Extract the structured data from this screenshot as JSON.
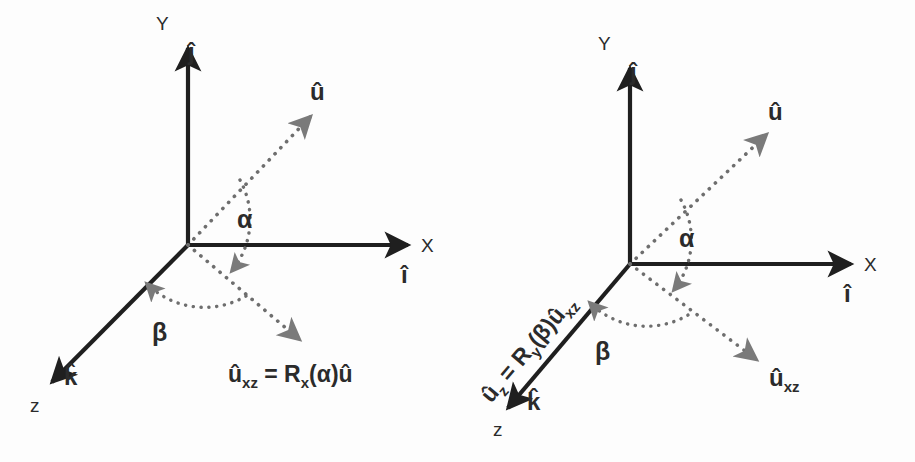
{
  "figure": {
    "background_color": "#fdfdfd",
    "axis_color": "#1f1f1f",
    "dotted_color": "#6e6e6e"
  },
  "panels": [
    {
      "id": "left",
      "caption": "Step 1: rotation about X by alpha",
      "axes": [
        {
          "name": "y-axis",
          "label": "Y"
        },
        {
          "name": "x-axis",
          "label": "X"
        },
        {
          "name": "z-axis",
          "label": "z"
        }
      ],
      "basis": [
        {
          "name": "j-hat",
          "label": "ĵ"
        },
        {
          "name": "i-hat",
          "label": "î"
        },
        {
          "name": "k-hat",
          "label": "k̂"
        }
      ],
      "vectors": [
        {
          "name": "u-hat",
          "label": "û"
        },
        {
          "name": "u-xz",
          "label": ""
        }
      ],
      "angles": [
        {
          "name": "alpha",
          "label": "α"
        },
        {
          "name": "beta",
          "label": "β"
        }
      ],
      "formula": {
        "lhs_base": "û",
        "lhs_sub": "xz",
        "eq": " = R",
        "op_sub": "x",
        "rhs": "(α)û"
      }
    },
    {
      "id": "right",
      "caption": "Step 2: rotation about Y by beta",
      "axes": [
        {
          "name": "y-axis",
          "label": "Y"
        },
        {
          "name": "x-axis",
          "label": "X"
        },
        {
          "name": "z-axis",
          "label": "z"
        }
      ],
      "basis": [
        {
          "name": "j-hat",
          "label": "ĵ"
        },
        {
          "name": "i-hat",
          "label": "î"
        },
        {
          "name": "k-hat",
          "label": "k̂"
        }
      ],
      "vectors": [
        {
          "name": "u-hat",
          "label": "û"
        },
        {
          "name": "u-xz",
          "label_base": "û",
          "label_sub": "xz"
        }
      ],
      "angles": [
        {
          "name": "alpha",
          "label": "α"
        },
        {
          "name": "beta",
          "label": "β"
        }
      ],
      "formula": {
        "lhs_base": "û",
        "lhs_sub": "z",
        "eq": " = R",
        "op_sub": "y",
        "rhs": "(β)û",
        "rhs_sub": "xz"
      }
    }
  ]
}
